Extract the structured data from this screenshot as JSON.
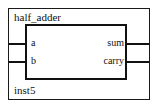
{
  "symbol": {
    "entity_name": "half_adder",
    "instance_name": "inst5",
    "ports": {
      "inputs": [
        {
          "name": "a"
        },
        {
          "name": "b"
        }
      ],
      "outputs": [
        {
          "name": "sum"
        },
        {
          "name": "carry"
        }
      ]
    },
    "colors": {
      "line": "#111111",
      "outer_border": "#1a1a1a",
      "background": "#ffffff",
      "text": "#111111"
    }
  }
}
